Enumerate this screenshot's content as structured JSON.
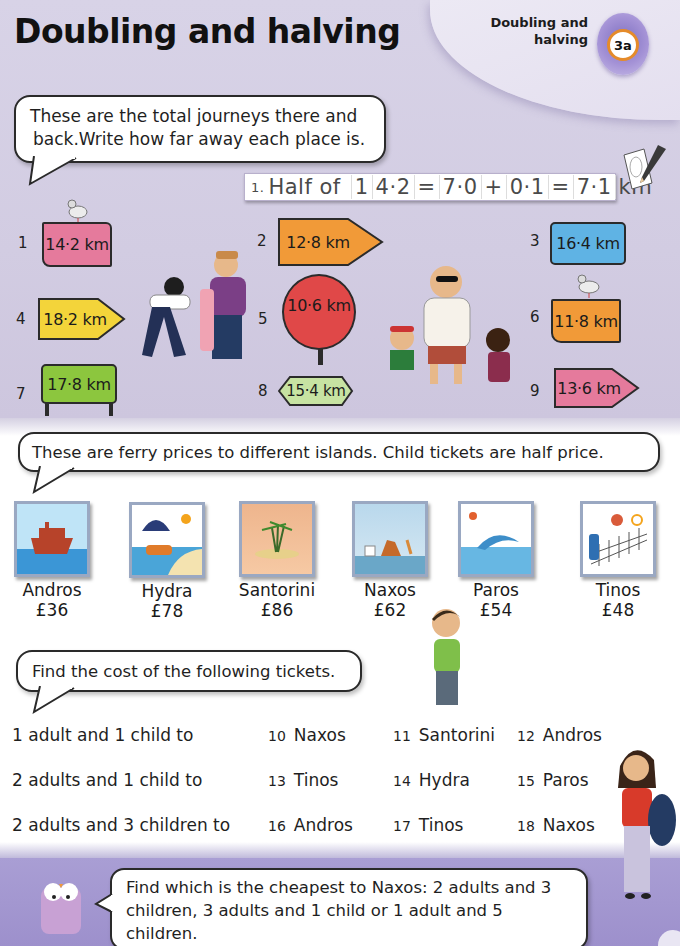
{
  "header": {
    "title": "Doubling and halving",
    "unit_label_line1": "Doubling and",
    "unit_label_line2": "halving",
    "unit_badge": "3a"
  },
  "colors": {
    "background_top": "#d6d0e5",
    "bottom_band": "#a99ed4",
    "sign_pink": "#e57a9c",
    "sign_green": "#8cc63e",
    "sign_orange": "#f19a38",
    "sign_yellow": "#f3d43a",
    "sign_blue": "#5fb3e4",
    "sign_red": "#e04848",
    "badge_ring": "#e58b2a"
  },
  "journeys": {
    "instruction": "These are the total journeys there and back.Write how far away each place is.",
    "instruction_line1": "These are the total journeys there and",
    "instruction_line2": "back.Write how far away each place is.",
    "example": {
      "number": "1.",
      "text_half_of": "Half of",
      "cells": [
        "1",
        "4·2",
        "=",
        "7·0",
        "+",
        "0·1",
        "=",
        "7·1",
        "km"
      ]
    },
    "signs": [
      {
        "number": "1",
        "distance": "14·2 km",
        "shape": "board",
        "color": "#e57a9c"
      },
      {
        "number": "2",
        "distance": "12·8 km",
        "shape": "arrow-right",
        "color": "#f19a38"
      },
      {
        "number": "3",
        "distance": "16·4 km",
        "shape": "rect",
        "color": "#5fb3e4"
      },
      {
        "number": "4",
        "distance": "18·2 km",
        "shape": "arrow-right",
        "color": "#f3d43a"
      },
      {
        "number": "5",
        "distance": "10·6 km",
        "shape": "circle",
        "color": "#e04848"
      },
      {
        "number": "6",
        "distance": "11·8 km",
        "shape": "board",
        "color": "#f19a38"
      },
      {
        "number": "7",
        "distance": "17·8 km",
        "shape": "post-sign",
        "color": "#8cc63e"
      },
      {
        "number": "8",
        "distance": "15·4 km",
        "shape": "arrow-both",
        "color": "#c7e3a2"
      },
      {
        "number": "9",
        "distance": "13·6 km",
        "shape": "arrow-right",
        "color": "#e57a9c"
      }
    ]
  },
  "ferry": {
    "instruction": "These are ferry prices to different islands. Child tickets are half price.",
    "islands": [
      {
        "name": "Andros",
        "price": "£36",
        "image": "boat"
      },
      {
        "name": "Hydra",
        "price": "£78",
        "image": "beach-umbrella"
      },
      {
        "name": "Santorini",
        "price": "£86",
        "image": "palm-island"
      },
      {
        "name": "Naxos",
        "price": "£62",
        "image": "sandcastle"
      },
      {
        "name": "Paros",
        "price": "£54",
        "image": "dolphin"
      },
      {
        "name": "Tinos",
        "price": "£48",
        "image": "volleyball"
      }
    ]
  },
  "tickets": {
    "instruction": "Find the cost of the following tickets.",
    "rows": [
      {
        "lead": "1 adult and 1 child to",
        "items": [
          {
            "n": "10",
            "place": "Naxos"
          },
          {
            "n": "11",
            "place": "Santorini"
          },
          {
            "n": "12",
            "place": "Andros"
          }
        ]
      },
      {
        "lead": "2 adults and 1 child to",
        "items": [
          {
            "n": "13",
            "place": "Tinos"
          },
          {
            "n": "14",
            "place": "Hydra"
          },
          {
            "n": "15",
            "place": "Paros"
          }
        ]
      },
      {
        "lead": "2 adults and 3 children to",
        "items": [
          {
            "n": "16",
            "place": "Andros"
          },
          {
            "n": "17",
            "place": "Tinos"
          },
          {
            "n": "18",
            "place": "Naxos"
          }
        ]
      }
    ]
  },
  "challenge": {
    "line1": "Find which is the cheapest to Naxos: 2 adults and 3",
    "line2": "children, 3 adults and 1 child or 1 adult and 5 children.",
    "line3": "Write a question like this for your friend to answer."
  }
}
